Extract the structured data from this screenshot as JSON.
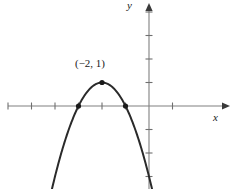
{
  "figure": {
    "name": "parabola-graph",
    "background": "#ffffff",
    "width": 233,
    "height": 189
  },
  "axes": {
    "x_label": "x",
    "y_label": "y",
    "axis_color": "#808080",
    "origin_px": [
      149,
      106
    ],
    "unit_px": 23.5,
    "x_axis": {
      "start_px": 8,
      "end_px": 226,
      "arrow": "right"
    },
    "y_axis": {
      "start_px": 6,
      "end_px": 189,
      "arrow": "up"
    },
    "x_ticks": [
      -6,
      -5,
      -4,
      -3,
      -2,
      -1,
      1
    ],
    "y_ticks": [
      -3,
      -2,
      -1,
      1,
      2,
      3,
      4
    ],
    "tick_half_len_px": 3.5,
    "grid": false
  },
  "annotations": {
    "vertex_label": "(−2, 1)",
    "vertex_label_color": "#1a1a1a"
  },
  "chart_data": {
    "type": "line",
    "title": "",
    "subtitle": "",
    "xlabel": "x",
    "ylabel": "y",
    "xlim": [
      -6,
      1
    ],
    "ylim": [
      -3.5,
      4
    ],
    "grid": false,
    "legend": "none",
    "curve_color": "#2a2a2a",
    "point_color": "#1a1a1a",
    "series": [
      {
        "name": "parabola",
        "kind": "quadratic",
        "equation": "y = -(x + 2)^2 + 1",
        "vertex": [
          -2,
          1
        ],
        "opens": "down",
        "leading_coefficient": -1,
        "roots": [
          -3,
          -1
        ],
        "x": [
          -4.1,
          -3.8,
          -3.5,
          -3.2,
          -3.0,
          -2.8,
          -2.5,
          -2.2,
          -2.0,
          -1.8,
          -1.5,
          -1.2,
          -1.0,
          -0.8,
          -0.5,
          -0.2,
          0.0
        ],
        "values": [
          -3.41,
          -2.24,
          -1.25,
          -0.44,
          0.0,
          0.36,
          0.75,
          0.96,
          1.0,
          0.96,
          0.75,
          0.36,
          0.0,
          -0.44,
          -1.25,
          -2.24,
          -3.0
        ]
      }
    ],
    "marked_points": [
      {
        "name": "vertex",
        "x": -2,
        "y": 1,
        "label": "(−2, 1)"
      },
      {
        "name": "left-x-intercept",
        "x": -3,
        "y": 0,
        "label": ""
      },
      {
        "name": "right-x-intercept",
        "x": -1,
        "y": 0,
        "label": ""
      }
    ]
  }
}
